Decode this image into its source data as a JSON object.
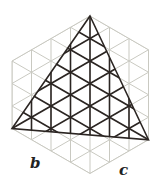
{
  "figure": {
    "labels": {
      "b": "b",
      "c": "c"
    },
    "colors": {
      "grid": "#c9c9c1",
      "triangle": "#2b2522",
      "label": "#222222",
      "background": "#ffffff"
    },
    "hexagon": [
      [
        90,
        16
      ],
      [
        148.5,
        49.75
      ],
      [
        148.5,
        139.75
      ],
      [
        90,
        173.5
      ],
      [
        12,
        128.5
      ],
      [
        12,
        61
      ]
    ],
    "triangle": [
      [
        90,
        16
      ],
      [
        12,
        128.5
      ],
      [
        148.5,
        139.75
      ]
    ],
    "lattice": {
      "origin": [
        90,
        16
      ],
      "dx": 19.5,
      "dy": 22.5
    }
  }
}
